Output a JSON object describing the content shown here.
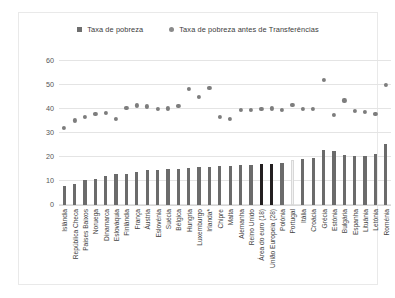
{
  "legend": {
    "items": [
      {
        "label": "Taxa de pobreza",
        "marker": "square-marker-icon",
        "color": "#6e6e6e"
      },
      {
        "label": "Taxa de pobreza antes de Transferências",
        "marker": "circle-marker-icon",
        "color": "#8a8a8a"
      }
    ]
  },
  "chart_data": {
    "type": "bar",
    "title": "",
    "subtitle": "",
    "xlabel": "",
    "ylabel": "",
    "ylim": [
      0,
      60
    ],
    "yticks": [
      0,
      10,
      20,
      30,
      40,
      50,
      60
    ],
    "grid": true,
    "legend_position": "top-center",
    "highlight_colors": {
      "default_bar": "#6b6b6b",
      "aggregate_bar": "#231f20",
      "portugal_bar": "#f2f2f2",
      "marker": "#7d7d7d"
    },
    "categories": [
      "Islândia",
      "República Checa",
      "Países Baixos",
      "Noruega",
      "Dinamarca",
      "Eslováquia",
      "Finlândia",
      "França",
      "Áustria",
      "Eslovénia",
      "Suécia",
      "Bélgica",
      "Hungria",
      "Luxemburgo",
      "Irlanda*",
      "Chipre",
      "Malta",
      "Alemanha",
      "Reino Unido",
      "Área do euro (18)",
      "União Europeia (28)",
      "Polónia",
      "Portugal",
      "Itália",
      "Croácia",
      "Grécia",
      "Estónia",
      "Bulgária",
      "Espanha",
      "Lituânia",
      "Letónia",
      "Roménia"
    ],
    "series": [
      {
        "name": "Taxa de pobreza",
        "type": "bar",
        "values": [
          8.0,
          8.6,
          10.4,
          10.8,
          11.9,
          12.8,
          13.1,
          13.7,
          14.4,
          14.5,
          14.8,
          15.1,
          15.3,
          15.9,
          16.0,
          16.1,
          16.3,
          16.5,
          16.8,
          17.0,
          17.2,
          17.3,
          18.7,
          19.1,
          19.5,
          23.1,
          22.6,
          21.0,
          20.4,
          20.6,
          21.2,
          25.4
        ]
      },
      {
        "name": "Taxa de pobreza antes de Transferências",
        "type": "scatter",
        "values": [
          32.0,
          35.2,
          36.6,
          38.0,
          38.4,
          35.8,
          40.5,
          41.4,
          41.0,
          40.0,
          40.2,
          41.3,
          48.4,
          44.8,
          48.8,
          36.5,
          35.8,
          39.6,
          39.7,
          40.0,
          40.2,
          39.6,
          41.5,
          40.0,
          39.9,
          52.0,
          37.4,
          43.5,
          39.0,
          38.8,
          38.0,
          49.8
        ]
      }
    ]
  }
}
